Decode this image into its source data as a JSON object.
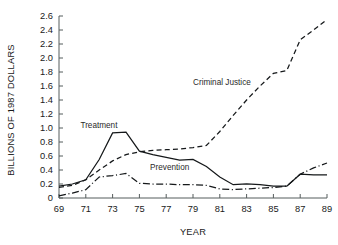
{
  "chart_data": {
    "type": "line",
    "title": "",
    "xlabel": "YEAR",
    "ylabel": "BILLIONS OF 1987 DOLLARS",
    "xlim": [
      69,
      89
    ],
    "ylim": [
      0,
      2.6
    ],
    "grid": false,
    "legend_position": "inline-annotations",
    "x_tick_labels": [
      "69",
      "71",
      "73",
      "75",
      "77",
      "79",
      "81",
      "83",
      "85",
      "87",
      "89"
    ],
    "x_tick_values": [
      69,
      71,
      73,
      75,
      77,
      79,
      81,
      83,
      85,
      87,
      89
    ],
    "y_tick_labels": [
      "0",
      "0.2",
      "0.4",
      "0.6",
      "0.8",
      "1.0",
      "1.2",
      "1.4",
      "1.6",
      "1.8",
      "2.0",
      "2.2",
      "2.4",
      "2.6"
    ],
    "y_tick_values": [
      0,
      0.2,
      0.4,
      0.6,
      0.8,
      1.0,
      1.2,
      1.4,
      1.6,
      1.8,
      2.0,
      2.2,
      2.4,
      2.6
    ],
    "x": [
      69,
      70,
      71,
      72,
      73,
      74,
      75,
      76,
      77,
      78,
      79,
      80,
      81,
      82,
      83,
      84,
      85,
      86,
      87,
      88,
      89
    ],
    "series": [
      {
        "name": "Criminal Justice",
        "style": "dashed",
        "color": "#15181a",
        "values": [
          0.15,
          0.18,
          0.26,
          0.4,
          0.53,
          0.62,
          0.66,
          0.68,
          0.69,
          0.7,
          0.72,
          0.75,
          0.95,
          1.18,
          1.4,
          1.6,
          1.78,
          1.82,
          2.26,
          2.4,
          2.55
        ]
      },
      {
        "name": "Treatment",
        "style": "solid",
        "color": "#15181a",
        "values": [
          0.17,
          0.2,
          0.26,
          0.55,
          0.93,
          0.94,
          0.67,
          0.62,
          0.58,
          0.54,
          0.55,
          0.45,
          0.3,
          0.19,
          0.2,
          0.19,
          0.17,
          0.17,
          0.34,
          0.33,
          0.33
        ]
      },
      {
        "name": "Prevention",
        "style": "dashdot",
        "color": "#15181a",
        "values": [
          0.03,
          0.07,
          0.12,
          0.3,
          0.32,
          0.35,
          0.21,
          0.2,
          0.2,
          0.19,
          0.19,
          0.18,
          0.13,
          0.12,
          0.13,
          0.14,
          0.15,
          0.17,
          0.34,
          0.43,
          0.5
        ]
      }
    ],
    "annotations": [
      {
        "text": "Treatment",
        "x": 70.6,
        "y": 1.0
      },
      {
        "text": "Criminal Justice",
        "x": 79.0,
        "y": 1.62
      },
      {
        "text": "Prevention",
        "x": 75.8,
        "y": 0.4
      }
    ]
  }
}
